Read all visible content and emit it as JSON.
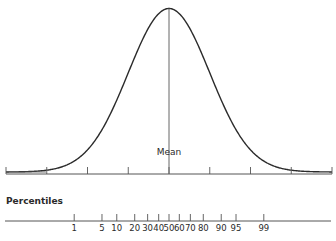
{
  "chart_data": {
    "type": "line",
    "title": "",
    "curve": {
      "distribution": "normal",
      "mean": 0,
      "sd": 1,
      "x_range_sd": [
        -4,
        4
      ]
    },
    "mean_label": "Mean",
    "sd_ticks": [
      -4,
      -3,
      -2,
      -1,
      0,
      1,
      2,
      3,
      4
    ],
    "percentiles_label": "Percentiles",
    "percentile_ticks": [
      1,
      5,
      10,
      20,
      30,
      40,
      50,
      60,
      70,
      80,
      90,
      95,
      99
    ],
    "colors": {
      "line": "#2b2b2b",
      "axis": "#555555"
    }
  }
}
